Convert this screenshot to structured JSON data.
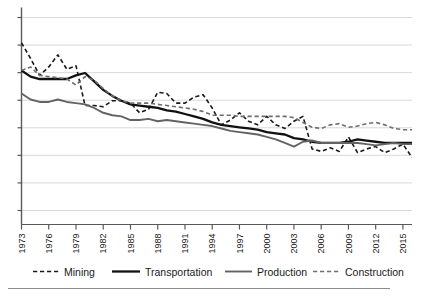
{
  "chart_data": {
    "type": "line",
    "title": "",
    "xlabel": "",
    "ylabel": "",
    "grid": true,
    "grid_lines": 8,
    "legend_position": "bottom",
    "axis_y_labels_shown": false,
    "xlim": [
      1973,
      2016
    ],
    "ylim": [
      0,
      8
    ],
    "x": [
      1973,
      1974,
      1975,
      1976,
      1977,
      1978,
      1979,
      1980,
      1981,
      1982,
      1983,
      1984,
      1985,
      1986,
      1987,
      1988,
      1989,
      1990,
      1991,
      1992,
      1993,
      1994,
      1995,
      1996,
      1997,
      1998,
      1999,
      2000,
      2001,
      2002,
      2003,
      2004,
      2005,
      2006,
      2007,
      2008,
      2009,
      2010,
      2011,
      2012,
      2013,
      2014,
      2015,
      2016
    ],
    "tick_labels": [
      "1973",
      "1976",
      "1979",
      "1982",
      "1985",
      "1988",
      "1991",
      "1994",
      "1997",
      "2000",
      "2003",
      "2006",
      "2009",
      "2012",
      "2015"
    ],
    "tick_years": [
      1973,
      1976,
      1979,
      1982,
      1985,
      1988,
      1991,
      1994,
      1997,
      2000,
      2003,
      2006,
      2009,
      2012,
      2015
    ],
    "series": [
      {
        "name": "Mining",
        "style": "dashed",
        "color": "#1a1a1a",
        "width": 1.6,
        "values": [
          6.95,
          6.3,
          5.6,
          5.95,
          6.45,
          5.85,
          6.0,
          4.35,
          4.35,
          4.3,
          4.55,
          4.55,
          4.45,
          4.05,
          4.2,
          4.9,
          4.85,
          4.45,
          4.45,
          4.7,
          4.8,
          4.25,
          3.55,
          3.75,
          4.05,
          3.7,
          3.55,
          3.9,
          3.55,
          3.4,
          3.7,
          3.9,
          2.55,
          2.45,
          2.6,
          2.45,
          3.05,
          2.4,
          2.55,
          2.65,
          2.4,
          2.55,
          2.75,
          2.2
        ]
      },
      {
        "name": "Transportation",
        "style": "solid",
        "color": "#111111",
        "width": 2.3,
        "values": [
          5.8,
          5.55,
          5.45,
          5.45,
          5.45,
          5.45,
          5.6,
          5.7,
          5.35,
          5.0,
          4.75,
          4.55,
          4.4,
          4.35,
          4.3,
          4.25,
          4.15,
          4.1,
          4.0,
          3.9,
          3.8,
          3.65,
          3.55,
          3.5,
          3.45,
          3.4,
          3.35,
          3.25,
          3.2,
          3.15,
          3.0,
          2.95,
          2.85,
          2.8,
          2.8,
          2.8,
          2.85,
          2.95,
          2.9,
          2.85,
          2.8,
          2.8,
          2.8,
          2.8
        ]
      },
      {
        "name": "Production",
        "style": "solid",
        "color": "#636363",
        "width": 1.9,
        "values": [
          4.85,
          4.6,
          4.5,
          4.5,
          4.6,
          4.5,
          4.45,
          4.4,
          4.25,
          4.05,
          3.95,
          3.9,
          3.75,
          3.75,
          3.8,
          3.7,
          3.75,
          3.7,
          3.65,
          3.6,
          3.55,
          3.5,
          3.4,
          3.3,
          3.25,
          3.2,
          3.15,
          3.05,
          2.95,
          2.8,
          2.65,
          2.85,
          2.9,
          2.8,
          2.8,
          2.8,
          2.8,
          2.8,
          2.75,
          2.7,
          2.75,
          2.8,
          2.75,
          2.75
        ]
      },
      {
        "name": "Construction",
        "style": "dashed",
        "color": "#6e6e6e",
        "width": 1.6,
        "values": [
          5.8,
          5.95,
          5.6,
          5.55,
          5.5,
          5.45,
          5.2,
          5.55,
          5.4,
          5.05,
          4.75,
          4.55,
          4.45,
          4.45,
          4.45,
          4.4,
          4.35,
          4.3,
          4.25,
          4.2,
          4.1,
          3.95,
          3.95,
          3.95,
          3.9,
          3.9,
          3.9,
          3.9,
          3.9,
          3.9,
          3.85,
          3.65,
          3.45,
          3.4,
          3.55,
          3.6,
          3.45,
          3.5,
          3.6,
          3.65,
          3.55,
          3.4,
          3.35,
          3.35
        ]
      }
    ]
  },
  "legend": {
    "items": [
      {
        "label": "Mining"
      },
      {
        "label": "Transportation"
      },
      {
        "label": "Production"
      },
      {
        "label": "Construction"
      }
    ]
  },
  "colors": {
    "grid": "#d9d9d9",
    "axis": "#595959",
    "text": "#1a1a1a",
    "background": "#ffffff",
    "rule": "#8c8c8c"
  }
}
